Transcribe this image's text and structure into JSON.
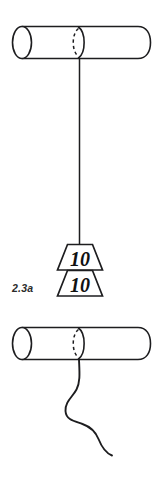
{
  "figure": {
    "caption": "2.3a",
    "stroke_color": "#1d1d1f",
    "fill_color": "#ffffff",
    "background_color": "#ffffff"
  },
  "top_assembly": {
    "rod_name": "top-rod",
    "string_name": "taut-string",
    "string_state": "taut",
    "weights": [
      {
        "label": "10",
        "position": "upper"
      },
      {
        "label": "10",
        "position": "lower"
      }
    ]
  },
  "bottom_assembly": {
    "rod_name": "bottom-rod",
    "string_name": "slack-string",
    "string_state": "slack",
    "weights": []
  }
}
